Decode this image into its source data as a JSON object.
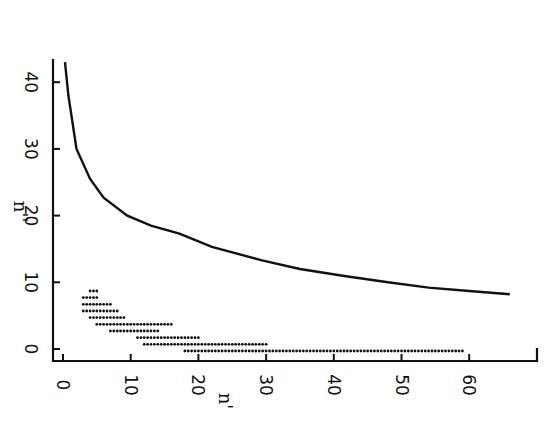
{
  "chart_data": {
    "type": "line",
    "title": "",
    "xlabel": "n'",
    "ylabel": "n''",
    "xlim": [
      0,
      70
    ],
    "ylim": [
      0,
      43
    ],
    "x_ticks": [
      0,
      10,
      20,
      30,
      40,
      50,
      60
    ],
    "x_tick_labels": [
      "0",
      "10",
      "20",
      "30",
      "40",
      "50",
      "60"
    ],
    "y_ticks": [
      0,
      10,
      20,
      30,
      40
    ],
    "y_tick_labels": [
      "0",
      "10",
      "20",
      "30",
      "40"
    ],
    "grid": false,
    "legend": null,
    "tick_label_rotation": 90,
    "series": [
      {
        "name": "boundary curve",
        "kind": "line",
        "x": [
          0.3,
          0.8,
          2,
          4,
          6,
          9.5,
          13,
          17.2,
          22,
          29.4,
          35,
          41.8,
          48,
          54,
          60,
          66
        ],
        "y": [
          43,
          38,
          30,
          25.5,
          22.7,
          20,
          18.5,
          17.3,
          15.3,
          13.3,
          12,
          10.9,
          10,
          9.2,
          8.7,
          8.2
        ]
      },
      {
        "name": "dotted region",
        "kind": "dot-rows",
        "rows": [
          {
            "y": 9,
            "x_from": 4,
            "x_to": 5
          },
          {
            "y": 8,
            "x_from": 3,
            "x_to": 5
          },
          {
            "y": 7,
            "x_from": 3,
            "x_to": 7
          },
          {
            "y": 6,
            "x_from": 3,
            "x_to": 8
          },
          {
            "y": 5,
            "x_from": 4,
            "x_to": 9
          },
          {
            "y": 4,
            "x_from": 5,
            "x_to": 16
          },
          {
            "y": 3,
            "x_from": 7,
            "x_to": 14
          },
          {
            "y": 2,
            "x_from": 11,
            "x_to": 20
          },
          {
            "y": 1,
            "x_from": 12,
            "x_to": 30
          },
          {
            "y": 0,
            "x_from": 18,
            "x_to": 59
          }
        ]
      }
    ]
  },
  "layout": {
    "x0_px": 63,
    "x_px_per_unit": 6.77,
    "y0_px": 349,
    "y_px_per_unit": 6.67,
    "axis_x_line_y": 361,
    "axis_y_line_x": 53,
    "axis_x_end_px": 537,
    "axis_y_top_px": 60
  }
}
